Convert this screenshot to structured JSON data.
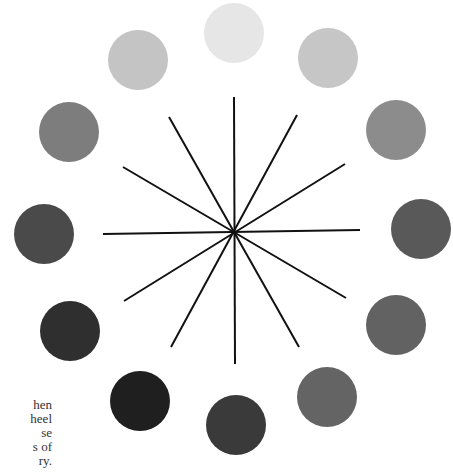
{
  "diagram": {
    "type": "value-wheel",
    "center": [
      234,
      232
    ],
    "lines": [
      {
        "x1": 234,
        "y1": 97,
        "x2": 235,
        "y2": 364
      },
      {
        "x1": 103,
        "y1": 234,
        "x2": 360,
        "y2": 230
      },
      {
        "x1": 169,
        "y1": 117,
        "x2": 299,
        "y2": 347
      },
      {
        "x1": 297,
        "y1": 115,
        "x2": 171,
        "y2": 347
      },
      {
        "x1": 123,
        "y1": 167,
        "x2": 346,
        "y2": 298
      },
      {
        "x1": 345,
        "y1": 164,
        "x2": 124,
        "y2": 301
      }
    ],
    "line_color": "#111111",
    "circles": [
      {
        "cx": 234,
        "cy": 33,
        "r": 30,
        "color": "#e6e6e6"
      },
      {
        "cx": 328,
        "cy": 58,
        "r": 30,
        "color": "#c6c6c6"
      },
      {
        "cx": 396,
        "cy": 130,
        "r": 30,
        "color": "#8c8c8c"
      },
      {
        "cx": 421,
        "cy": 229,
        "r": 30,
        "color": "#595959"
      },
      {
        "cx": 396,
        "cy": 325,
        "r": 30,
        "color": "#626262"
      },
      {
        "cx": 327,
        "cy": 397,
        "r": 30,
        "color": "#646464"
      },
      {
        "cx": 236,
        "cy": 425,
        "r": 30,
        "color": "#3a3a3a"
      },
      {
        "cx": 140,
        "cy": 401,
        "r": 30,
        "color": "#1f1f1f"
      },
      {
        "cx": 70,
        "cy": 331,
        "r": 30,
        "color": "#2f2f2f"
      },
      {
        "cx": 44,
        "cy": 234,
        "r": 30,
        "color": "#4a4a4a"
      },
      {
        "cx": 69,
        "cy": 132,
        "r": 30,
        "color": "#7d7d7d"
      },
      {
        "cx": 138,
        "cy": 60,
        "r": 30,
        "color": "#c4c4c4"
      }
    ]
  },
  "text_fragments": [
    "hen",
    "heel",
    "se",
    "s of",
    "ry."
  ]
}
